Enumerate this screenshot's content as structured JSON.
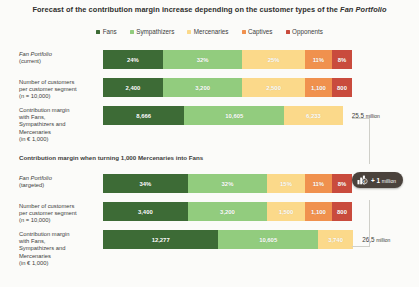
{
  "title": {
    "prefix": "Forecast of the contribution margin increase depending on the customer types of the ",
    "italic": "Fan Portfolio"
  },
  "legend": {
    "items": [
      {
        "label": "Fans",
        "color": "#3d6b36"
      },
      {
        "label": "Sympathizers",
        "color": "#92cc7e"
      },
      {
        "label": "Mercenaries",
        "color": "#fbd98a"
      },
      {
        "label": "Captives",
        "color": "#f0914e"
      },
      {
        "label": "Opponents",
        "color": "#c94b3d"
      }
    ]
  },
  "caption": "Contribution margin when turning 1,000 Mercenaries into Fans",
  "badge": {
    "text": "+ 1",
    "unit": "million",
    "icon": "bar-chart-euro-icon"
  },
  "chart_data": {
    "type": "bar",
    "orientation": "horizontal",
    "stacked": true,
    "title": "Forecast of the contribution margin increase depending on the customer types of the Fan Portfolio",
    "legend_position": "top-center",
    "categories": [
      "Fans",
      "Sympathizers",
      "Mercenaries",
      "Captives",
      "Opponents"
    ],
    "colors": [
      "#3d6b36",
      "#92cc7e",
      "#fbd98a",
      "#f0914e",
      "#c94b3d"
    ],
    "groups": [
      {
        "name": "current",
        "label_line1": "Fan Portfolio",
        "label_line1_italic": true,
        "label_line2": "(current)",
        "label_line3": "",
        "label_line4": "",
        "rows": [
          {
            "label_lines": [
              "Fan Portfolio",
              "(current)"
            ],
            "label_italic_first": true,
            "unit": "%",
            "values": [
              24,
              32,
              25,
              11,
              8
            ],
            "display": [
              "24%",
              "32%",
              "25%",
              "11%",
              "8%"
            ],
            "total": ""
          },
          {
            "label_lines": [
              "Number of customers",
              "per customer segment",
              "(n = 10,000)"
            ],
            "label_italic_first": false,
            "unit": "customers",
            "values": [
              2400,
              3200,
              2500,
              1100,
              800
            ],
            "display": [
              "2,400",
              "3,200",
              "2,500",
              "1,100",
              "800"
            ],
            "total": ""
          },
          {
            "label_lines": [
              "Contribution margin",
              "with Fans,",
              "Sympathizers and",
              "Mercenaries",
              "(in € 1,000)"
            ],
            "label_italic_first": false,
            "unit": "€ 1,000",
            "values": [
              8666,
              10605,
              6233
            ],
            "display": [
              "8,666",
              "10,605",
              "6,233"
            ],
            "total": "25,5",
            "total_unit": "million"
          }
        ]
      },
      {
        "name": "targeted",
        "rows": [
          {
            "label_lines": [
              "Fan Portfolio",
              "(targeted)"
            ],
            "label_italic_first": true,
            "unit": "%",
            "values": [
              34,
              32,
              15,
              11,
              8
            ],
            "display": [
              "34%",
              "32%",
              "15%",
              "11%",
              "8%"
            ],
            "total": ""
          },
          {
            "label_lines": [
              "Number of customers",
              "per customer segment",
              "(n = 10,000)"
            ],
            "label_italic_first": false,
            "unit": "customers",
            "values": [
              3400,
              3200,
              1500,
              1100,
              800
            ],
            "display": [
              "3,400",
              "3,200",
              "1,500",
              "1,100",
              "800"
            ],
            "total": ""
          },
          {
            "label_lines": [
              "Contribution margin",
              "with Fans,",
              "Sympathizers and",
              "Mercenaries",
              "(in € 1,000)"
            ],
            "label_italic_first": false,
            "unit": "€ 1,000",
            "values": [
              12277,
              10605,
              3740
            ],
            "display": [
              "12,277",
              "10,605",
              "3,740"
            ],
            "total": "26,5",
            "total_unit": "million"
          }
        ]
      }
    ]
  }
}
